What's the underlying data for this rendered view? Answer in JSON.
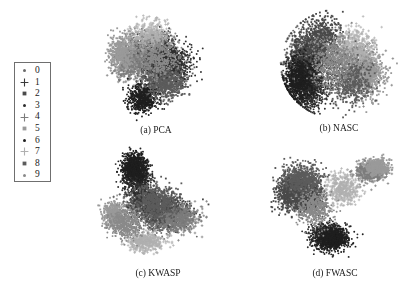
{
  "figure": {
    "background": "#ffffff",
    "width": 402,
    "height": 289
  },
  "legend": {
    "name": "class-legend",
    "border_color": "#6f6f6f",
    "items": [
      {
        "label": "0",
        "marker": "dot",
        "color": "#6b6b6b"
      },
      {
        "label": "1",
        "marker": "plus",
        "color": "#3a3a3a"
      },
      {
        "label": "2",
        "marker": "square",
        "color": "#4a4a4a"
      },
      {
        "label": "3",
        "marker": "dot",
        "color": "#2e2e2e"
      },
      {
        "label": "4",
        "marker": "plus",
        "color": "#7d7d7d"
      },
      {
        "label": "5",
        "marker": "square",
        "color": "#9a9a9a"
      },
      {
        "label": "6",
        "marker": "dot",
        "color": "#1f1f1f"
      },
      {
        "label": "7",
        "marker": "plus",
        "color": "#b0b0b0"
      },
      {
        "label": "8",
        "marker": "square",
        "color": "#5c5c5c"
      },
      {
        "label": "9",
        "marker": "dot",
        "color": "#8a8a8a"
      }
    ]
  },
  "chart_data": [
    {
      "id": "pca",
      "type": "scatter",
      "title": "(a) PCA",
      "xlabel": "",
      "ylabel": "",
      "axes_visible": false,
      "grid": false,
      "xlim": [
        0,
        1
      ],
      "ylim": [
        0,
        1
      ],
      "legend_position": "external-left",
      "series": [
        {
          "name": "0",
          "color": "#6b6b6b",
          "marker": "dot",
          "n": 520,
          "cx": 0.38,
          "cy": 0.58,
          "sx": 0.17,
          "sy": 0.15
        },
        {
          "name": "1",
          "color": "#3a3a3a",
          "marker": "plus",
          "n": 560,
          "cx": 0.56,
          "cy": 0.45,
          "sx": 0.16,
          "sy": 0.16
        },
        {
          "name": "2",
          "color": "#4a4a4a",
          "marker": "square",
          "n": 500,
          "cx": 0.5,
          "cy": 0.62,
          "sx": 0.15,
          "sy": 0.14
        },
        {
          "name": "3",
          "color": "#2e2e2e",
          "marker": "dot",
          "n": 540,
          "cx": 0.62,
          "cy": 0.52,
          "sx": 0.16,
          "sy": 0.15
        },
        {
          "name": "4",
          "color": "#7d7d7d",
          "marker": "plus",
          "n": 480,
          "cx": 0.3,
          "cy": 0.52,
          "sx": 0.13,
          "sy": 0.16
        },
        {
          "name": "5",
          "color": "#9a9a9a",
          "marker": "square",
          "n": 450,
          "cx": 0.24,
          "cy": 0.6,
          "sx": 0.11,
          "sy": 0.14
        },
        {
          "name": "6",
          "color": "#1f1f1f",
          "marker": "dot",
          "n": 620,
          "cx": 0.4,
          "cy": 0.22,
          "sx": 0.12,
          "sy": 0.11
        },
        {
          "name": "7",
          "color": "#b0b0b0",
          "marker": "plus",
          "n": 420,
          "cx": 0.46,
          "cy": 0.72,
          "sx": 0.15,
          "sy": 0.12
        },
        {
          "name": "8",
          "color": "#5c5c5c",
          "marker": "square",
          "n": 500,
          "cx": 0.58,
          "cy": 0.34,
          "sx": 0.15,
          "sy": 0.13
        },
        {
          "name": "9",
          "color": "#8a8a8a",
          "marker": "dot",
          "n": 480,
          "cx": 0.52,
          "cy": 0.55,
          "sx": 0.18,
          "sy": 0.16
        }
      ]
    },
    {
      "id": "nasc",
      "type": "scatter",
      "title": "(b) NASC",
      "xlabel": "",
      "ylabel": "",
      "axes_visible": false,
      "grid": false,
      "xlim": [
        0,
        1
      ],
      "ylim": [
        0,
        1
      ],
      "legend_position": "external-left",
      "shape": "ellipse",
      "series": [
        {
          "name": "0",
          "color": "#6b6b6b",
          "marker": "dot",
          "n": 600,
          "cx": 0.3,
          "cy": 0.55,
          "sx": 0.17,
          "sy": 0.22
        },
        {
          "name": "1",
          "color": "#3a3a3a",
          "marker": "plus",
          "n": 640,
          "cx": 0.22,
          "cy": 0.5,
          "sx": 0.14,
          "sy": 0.24
        },
        {
          "name": "2",
          "color": "#4a4a4a",
          "marker": "square",
          "n": 560,
          "cx": 0.36,
          "cy": 0.7,
          "sx": 0.16,
          "sy": 0.17
        },
        {
          "name": "3",
          "color": "#2e2e2e",
          "marker": "dot",
          "n": 600,
          "cx": 0.26,
          "cy": 0.3,
          "sx": 0.14,
          "sy": 0.16
        },
        {
          "name": "4",
          "color": "#7d7d7d",
          "marker": "plus",
          "n": 500,
          "cx": 0.66,
          "cy": 0.48,
          "sx": 0.16,
          "sy": 0.2
        },
        {
          "name": "5",
          "color": "#9a9a9a",
          "marker": "square",
          "n": 520,
          "cx": 0.72,
          "cy": 0.4,
          "sx": 0.14,
          "sy": 0.18
        },
        {
          "name": "6",
          "color": "#1f1f1f",
          "marker": "dot",
          "n": 680,
          "cx": 0.18,
          "cy": 0.38,
          "sx": 0.12,
          "sy": 0.18
        },
        {
          "name": "7",
          "color": "#b0b0b0",
          "marker": "plus",
          "n": 440,
          "cx": 0.62,
          "cy": 0.62,
          "sx": 0.15,
          "sy": 0.17
        },
        {
          "name": "8",
          "color": "#5c5c5c",
          "marker": "square",
          "n": 540,
          "cx": 0.58,
          "cy": 0.36,
          "sx": 0.16,
          "sy": 0.18
        },
        {
          "name": "9",
          "color": "#8a8a8a",
          "marker": "dot",
          "n": 520,
          "cx": 0.46,
          "cy": 0.52,
          "sx": 0.18,
          "sy": 0.22
        }
      ]
    },
    {
      "id": "kwasp",
      "type": "scatter",
      "title": "(c) KWASP",
      "xlabel": "",
      "ylabel": "",
      "axes_visible": false,
      "grid": false,
      "xlim": [
        0,
        1
      ],
      "ylim": [
        0,
        1
      ],
      "legend_position": "external-left",
      "shape": "fan",
      "series": [
        {
          "name": "0",
          "color": "#6b6b6b",
          "marker": "dot",
          "n": 540,
          "cx": 0.52,
          "cy": 0.38,
          "sx": 0.17,
          "sy": 0.12
        },
        {
          "name": "1",
          "color": "#3a3a3a",
          "marker": "plus",
          "n": 520,
          "cx": 0.4,
          "cy": 0.52,
          "sx": 0.14,
          "sy": 0.13
        },
        {
          "name": "2",
          "color": "#4a4a4a",
          "marker": "square",
          "n": 560,
          "cx": 0.58,
          "cy": 0.44,
          "sx": 0.17,
          "sy": 0.12
        },
        {
          "name": "3",
          "color": "#2e2e2e",
          "marker": "dot",
          "n": 600,
          "cx": 0.34,
          "cy": 0.72,
          "sx": 0.1,
          "sy": 0.13
        },
        {
          "name": "4",
          "color": "#7d7d7d",
          "marker": "plus",
          "n": 480,
          "cx": 0.66,
          "cy": 0.38,
          "sx": 0.16,
          "sy": 0.11
        },
        {
          "name": "5",
          "color": "#9a9a9a",
          "marker": "square",
          "n": 460,
          "cx": 0.16,
          "cy": 0.42,
          "sx": 0.08,
          "sy": 0.1
        },
        {
          "name": "6",
          "color": "#1f1f1f",
          "marker": "dot",
          "n": 720,
          "cx": 0.32,
          "cy": 0.8,
          "sx": 0.09,
          "sy": 0.11
        },
        {
          "name": "7",
          "color": "#b0b0b0",
          "marker": "plus",
          "n": 420,
          "cx": 0.4,
          "cy": 0.2,
          "sx": 0.14,
          "sy": 0.08
        },
        {
          "name": "8",
          "color": "#5c5c5c",
          "marker": "square",
          "n": 520,
          "cx": 0.48,
          "cy": 0.52,
          "sx": 0.16,
          "sy": 0.13
        },
        {
          "name": "9",
          "color": "#8a8a8a",
          "marker": "dot",
          "n": 500,
          "cx": 0.26,
          "cy": 0.34,
          "sx": 0.12,
          "sy": 0.12
        }
      ]
    },
    {
      "id": "fwasc",
      "type": "scatter",
      "title": "(d) FWASC",
      "xlabel": "",
      "ylabel": "",
      "axes_visible": false,
      "grid": false,
      "xlim": [
        0,
        1
      ],
      "ylim": [
        0,
        1
      ],
      "legend_position": "external-left",
      "shape": "clustered",
      "series": [
        {
          "name": "0",
          "color": "#6b6b6b",
          "marker": "dot",
          "n": 540,
          "cx": 0.22,
          "cy": 0.66,
          "sx": 0.13,
          "sy": 0.13
        },
        {
          "name": "1",
          "color": "#3a3a3a",
          "marker": "plus",
          "n": 520,
          "cx": 0.3,
          "cy": 0.56,
          "sx": 0.12,
          "sy": 0.13
        },
        {
          "name": "2",
          "color": "#4a4a4a",
          "marker": "square",
          "n": 560,
          "cx": 0.18,
          "cy": 0.58,
          "sx": 0.12,
          "sy": 0.14
        },
        {
          "name": "3",
          "color": "#2e2e2e",
          "marker": "dot",
          "n": 640,
          "cx": 0.44,
          "cy": 0.24,
          "sx": 0.13,
          "sy": 0.1
        },
        {
          "name": "4",
          "color": "#7d7d7d",
          "marker": "plus",
          "n": 420,
          "cx": 0.76,
          "cy": 0.76,
          "sx": 0.11,
          "sy": 0.08
        },
        {
          "name": "5",
          "color": "#9a9a9a",
          "marker": "square",
          "n": 400,
          "cx": 0.82,
          "cy": 0.8,
          "sx": 0.09,
          "sy": 0.07
        },
        {
          "name": "6",
          "color": "#1f1f1f",
          "marker": "dot",
          "n": 700,
          "cx": 0.48,
          "cy": 0.22,
          "sx": 0.12,
          "sy": 0.09
        },
        {
          "name": "7",
          "color": "#b0b0b0",
          "marker": "plus",
          "n": 420,
          "cx": 0.56,
          "cy": 0.62,
          "sx": 0.12,
          "sy": 0.12
        },
        {
          "name": "8",
          "color": "#5c5c5c",
          "marker": "square",
          "n": 500,
          "cx": 0.26,
          "cy": 0.7,
          "sx": 0.14,
          "sy": 0.12
        },
        {
          "name": "9",
          "color": "#8a8a8a",
          "marker": "dot",
          "n": 480,
          "cx": 0.34,
          "cy": 0.46,
          "sx": 0.14,
          "sy": 0.14
        }
      ]
    }
  ]
}
